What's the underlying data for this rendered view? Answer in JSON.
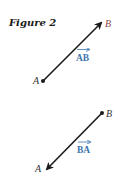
{
  "title": "Figure 2",
  "colors": {
    "line": "#1a1a1a",
    "vector_label": "#3b74ad",
    "point_b_top": "#8a4646",
    "point_label": "#333333"
  },
  "vectors": [
    {
      "name": "AB",
      "label": "AB",
      "tail_label": "A",
      "head_label": "B",
      "tail": [
        43,
        81
      ],
      "head": [
        103,
        21
      ]
    },
    {
      "name": "BA",
      "label": "BA",
      "tail_label": "B",
      "head_label": "A",
      "tail": [
        102,
        113
      ],
      "head": [
        45,
        171
      ]
    }
  ]
}
